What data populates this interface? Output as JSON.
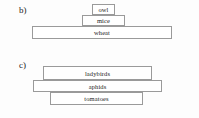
{
  "chart_data": {
    "type": "bar",
    "title": "",
    "xlabel": "",
    "ylabel": "",
    "charts": [
      {
        "id": "b",
        "label": "b)",
        "orientation": "upright-pyramid",
        "categories": [
          "owl",
          "mice",
          "wheat"
        ],
        "values": [
          23,
          43,
          140
        ],
        "unit": "relative bar width (px)",
        "levels": [
          {
            "name": "owl",
            "width": 23,
            "order": 1
          },
          {
            "name": "mice",
            "width": 43,
            "order": 2
          },
          {
            "name": "wheat",
            "width": 140,
            "order": 3
          }
        ]
      },
      {
        "id": "c",
        "label": "c)",
        "orientation": "irregular-pyramid",
        "categories": [
          "ladybirds",
          "aphids",
          "tomatoes"
        ],
        "values": [
          109,
          129,
          93
        ],
        "unit": "relative bar width (px)",
        "levels": [
          {
            "name": "ladybirds",
            "width": 109,
            "order": 1
          },
          {
            "name": "aphids",
            "width": 129,
            "order": 2
          },
          {
            "name": "tomatoes",
            "width": 93,
            "order": 3
          }
        ]
      }
    ],
    "colors": {
      "background": "#fdfdfd",
      "bar_fill": "#ffffff",
      "bar_stroke": "#9a9a9a",
      "text": "#1c1c1c"
    }
  },
  "sections": {
    "b": {
      "label": "b)",
      "levels": {
        "owl": "owl",
        "mice": "mice",
        "wheat": "wheat"
      }
    },
    "c": {
      "label": "c)",
      "levels": {
        "ladybirds": "ladybirds",
        "aphids": "aphids",
        "tomatoes": "tomatoes"
      }
    }
  }
}
